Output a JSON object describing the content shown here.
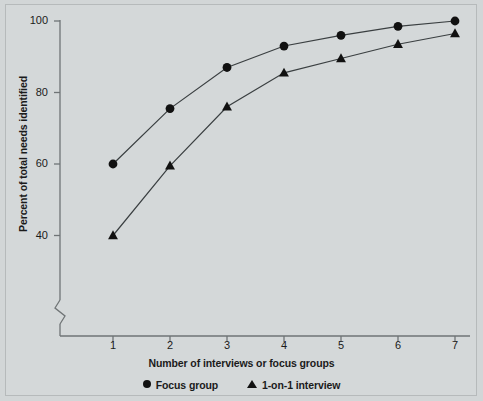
{
  "chart_data": {
    "type": "line",
    "title": "",
    "xlabel": "Number of interviews or focus groups",
    "ylabel": "Percent of total needs identified",
    "x": [
      1,
      2,
      3,
      4,
      5,
      6,
      7
    ],
    "xticklabels": [
      "1",
      "2",
      "3",
      "4",
      "5",
      "6",
      "7"
    ],
    "yticks": [
      40,
      60,
      80,
      100
    ],
    "yticklabels": [
      "40",
      "60",
      "80",
      "100"
    ],
    "ylim": [
      36,
      102
    ],
    "xlim": [
      0.45,
      7.35
    ],
    "grid": false,
    "axis_break": true,
    "legend_position": "below-axis",
    "series": [
      {
        "name": "Focus group",
        "marker": "circle",
        "color": "#111111",
        "values": [
          60,
          75.5,
          87,
          93,
          96,
          98.5,
          100
        ]
      },
      {
        "name": "1-on-1 interview",
        "marker": "triangle",
        "color": "#111111",
        "values": [
          40,
          59.5,
          76,
          85.5,
          89.5,
          93.5,
          96.5
        ]
      }
    ]
  },
  "legend": {
    "entries": [
      {
        "label": "Focus group",
        "marker": "circle-marker"
      },
      {
        "label": "1-on-1 interview",
        "marker": "triangle-marker"
      }
    ]
  },
  "colors": {
    "background": "#d4d8d9",
    "frame_border": "#b6babb",
    "axis": "#6f7476",
    "marker": "#111111",
    "line": "#3a3f41",
    "text": "#1b1b1b"
  }
}
